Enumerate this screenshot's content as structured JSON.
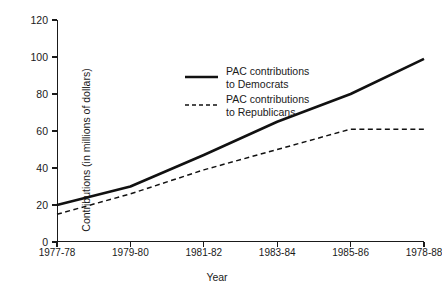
{
  "chart_data": {
    "type": "line",
    "title": "",
    "xlabel": "Year",
    "ylabel": "Contributions (in millions of dollars)",
    "categories": [
      "1977-78",
      "1979-80",
      "1981-82",
      "1983-84",
      "1985-86",
      "1978-88"
    ],
    "yticks": [
      0,
      20,
      40,
      60,
      80,
      100,
      120
    ],
    "ylim": [
      0,
      120
    ],
    "grid": false,
    "legend_position": "upper-left-inside",
    "series": [
      {
        "name": "PAC contributions to Democrats",
        "legend_line1": "PAC contributions",
        "legend_line2": "to Democrats",
        "style": "solid",
        "color": "#111111",
        "values": [
          20,
          30,
          47,
          65,
          80,
          99
        ]
      },
      {
        "name": "PAC contributions to Republicans",
        "legend_line1": "PAC contributions",
        "legend_line2": "to Republicans",
        "style": "dashed",
        "color": "#111111",
        "values": [
          15,
          26,
          39,
          50,
          61,
          61
        ]
      }
    ]
  }
}
